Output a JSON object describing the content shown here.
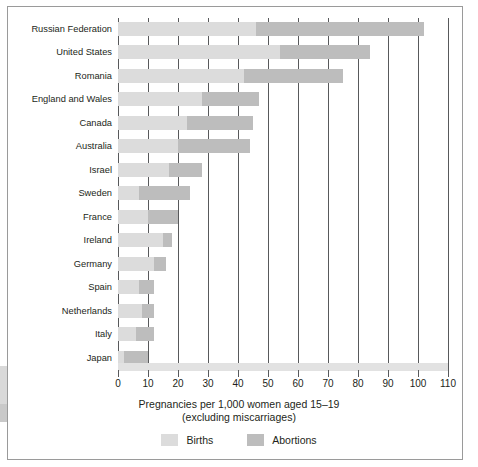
{
  "chart_data": {
    "type": "bar",
    "orientation": "horizontal",
    "stacked": true,
    "title": "",
    "xlabel": "Pregnancies per 1,000 women aged 15–19",
    "xlabel_line2": "(excluding miscarriages)",
    "ylabel": "",
    "xlim": [
      0,
      110
    ],
    "xticks": [
      0,
      10,
      20,
      30,
      40,
      50,
      60,
      70,
      80,
      90,
      100,
      110
    ],
    "xtick_labels": [
      "0",
      "10",
      "20",
      "30",
      "40",
      "50",
      "60",
      "70",
      "80",
      "90",
      "100",
      "110"
    ],
    "grid": true,
    "grid_axis": "x",
    "legend_position": "bottom",
    "categories": [
      "Russian Federation",
      "United States",
      "Romania",
      "England and Wales",
      "Canada",
      "Australia",
      "Israel",
      "Sweden",
      "France",
      "Ireland",
      "Germany",
      "Spain",
      "Netherlands",
      "Italy",
      "Japan"
    ],
    "series": [
      {
        "name": "Births",
        "color": "#dcdcdc",
        "values": [
          46,
          54,
          42,
          28,
          23,
          20,
          17,
          7,
          10,
          15,
          12,
          7,
          8,
          6,
          2
        ]
      },
      {
        "name": "Abortions",
        "color": "#bdbdbd",
        "values": [
          56,
          30,
          33,
          19,
          22,
          24,
          11,
          17,
          10,
          3,
          4,
          5,
          4,
          6,
          8
        ]
      }
    ],
    "totals": [
      102,
      84,
      75,
      47,
      45,
      44,
      28,
      24,
      20,
      18,
      16,
      12,
      12,
      12,
      10
    ]
  },
  "legend": {
    "items": [
      {
        "label": "Births",
        "color": "#dcdcdc"
      },
      {
        "label": "Abortions",
        "color": "#bdbdbd"
      }
    ]
  },
  "axis": {
    "title_line1": "Pregnancies per 1,000 women aged 15–19",
    "title_line2": "(excluding miscarriages)"
  }
}
